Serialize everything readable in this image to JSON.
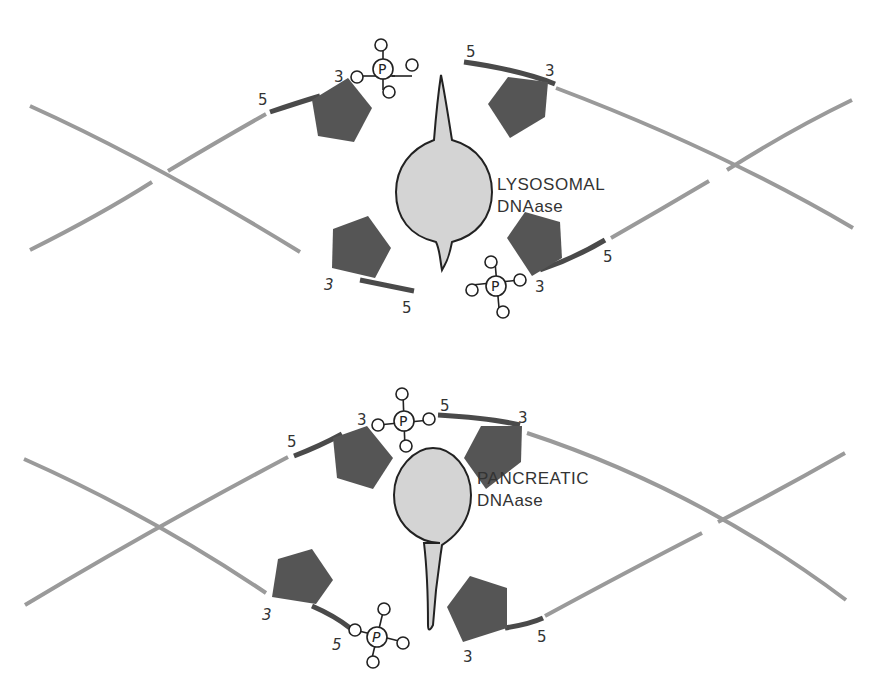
{
  "panels": [
    {
      "id": "lysosomal",
      "enzyme_label_line1": "LYSOSOMAL",
      "enzyme_label_line2": "DNAase",
      "end_labels": {
        "upper_left_5": "5",
        "upper_left_3": "3",
        "upper_right_5": "5",
        "upper_right_3": "3",
        "lower_left_3": "3",
        "lower_left_5": "5",
        "lower_right_5": "5",
        "lower_right_3": "3"
      },
      "phosphate_symbol": "P"
    },
    {
      "id": "pancreatic",
      "enzyme_label_line1": "PANCREATIC",
      "enzyme_label_line2": "DNAase",
      "end_labels": {
        "upper_left_5": "5",
        "upper_left_3": "3",
        "upper_right_5": "5",
        "upper_right_3": "3",
        "lower_left_3": "3",
        "lower_left_5": "5",
        "lower_right_5": "5",
        "lower_right_3": "3"
      },
      "phosphate_symbol": "P"
    }
  ]
}
